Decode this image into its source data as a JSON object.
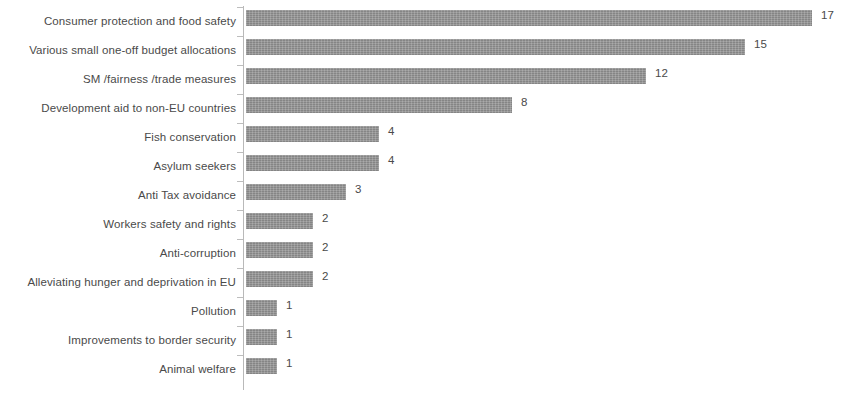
{
  "chart_data": {
    "type": "bar",
    "orientation": "horizontal",
    "title": "",
    "subtitle": "",
    "xlabel": "",
    "ylabel": "",
    "xlim": [
      0,
      17
    ],
    "grid": false,
    "legend": null,
    "bar_color": "#8f8f8f",
    "text_color": "#4a4a4a",
    "axis_color": "#b9b9b9",
    "categories": [
      "Consumer protection and food safety",
      "Various small one-off budget allocations",
      "SM /fairness /trade measures",
      "Development aid to non-EU countries",
      "Fish conservation",
      "Asylum seekers",
      "Anti Tax avoidance",
      "Workers safety and rights",
      "Anti-corruption",
      "Alleviating hunger and deprivation in EU",
      "Pollution",
      "Improvements to border security",
      "Animal welfare"
    ],
    "values": [
      17,
      15,
      12,
      8,
      4,
      4,
      3,
      2,
      2,
      2,
      1,
      1,
      1
    ],
    "value_labels": [
      "17",
      "15",
      "12",
      "8",
      "4",
      "4",
      "3",
      "2",
      "2",
      "2",
      "1",
      "1",
      "1"
    ]
  }
}
